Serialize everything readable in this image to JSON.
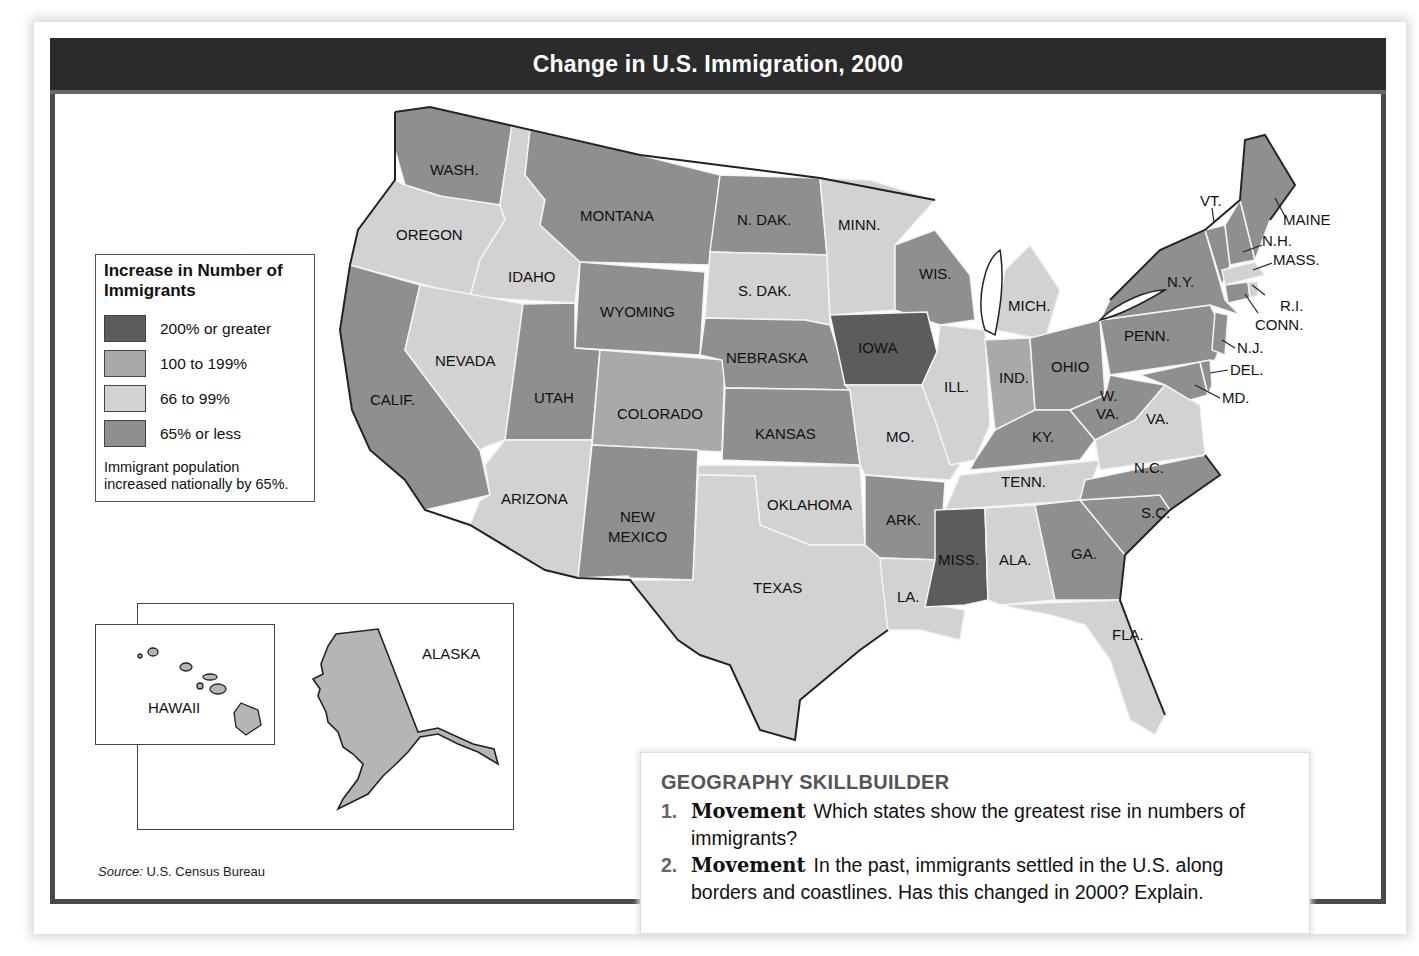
{
  "title": "Change in U.S. Immigration, 2000",
  "legend": {
    "heading": "Increase in Number of Immigrants",
    "items": [
      {
        "label": "200% or greater",
        "color": "#5c5c5c"
      },
      {
        "label": "100 to 199%",
        "color": "#a9a9a9"
      },
      {
        "label": "66 to 99%",
        "color": "#d2d2d2"
      },
      {
        "label": "65% or less",
        "color": "#8f8f8f"
      }
    ],
    "note": "Immigrant population increased nationally by 65%."
  },
  "states": {
    "wash": "WASH.",
    "oregon": "OREGON",
    "calif": "CALIF.",
    "idaho": "IDAHO",
    "nevada": "NEVADA",
    "montana": "MONTANA",
    "wyoming": "WYOMING",
    "utah": "UTAH",
    "arizona": "ARIZONA",
    "colorado": "COLORADO",
    "new_mexico_1": "NEW",
    "new_mexico_2": "MEXICO",
    "ndak": "N. DAK.",
    "sdak": "S. DAK.",
    "nebraska": "NEBRASKA",
    "kansas": "KANSAS",
    "oklahoma": "OKLAHOMA",
    "texas": "TEXAS",
    "minn": "MINN.",
    "iowa": "IOWA",
    "mo": "MO.",
    "ark": "ARK.",
    "la": "LA.",
    "wis": "WIS.",
    "ill": "ILL.",
    "mich": "MICH.",
    "ind": "IND.",
    "ohio": "OHIO",
    "ky": "KY.",
    "tenn": "TENN.",
    "miss": "MISS.",
    "ala": "ALA.",
    "ga": "GA.",
    "fla": "FLA.",
    "sc": "S.C.",
    "nc": "N.C.",
    "va": "VA.",
    "wva_1": "W.",
    "wva_2": "VA.",
    "penn": "PENN.",
    "ny": "N.Y.",
    "vt": "VT.",
    "nh": "N.H.",
    "maine": "MAINE",
    "mass": "MASS.",
    "ri": "R.I.",
    "conn": "CONN.",
    "nj": "N.J.",
    "del": "DEL.",
    "md": "MD.",
    "alaska": "ALASKA",
    "hawaii": "HAWAII"
  },
  "source": {
    "label": "Source:",
    "text": " U.S. Census Bureau"
  },
  "skillbuilder": {
    "heading": "GEOGRAPHY SKILLBUILDER",
    "questions": [
      {
        "num": "1.",
        "keyword": "Movement",
        "text": "Which states show the greatest rise in numbers of immigrants?"
      },
      {
        "num": "2.",
        "keyword": "Movement",
        "text": "In the past, immigrants settled in the U.S. along borders and coastlines. Has this changed in 2000? Explain."
      }
    ]
  }
}
